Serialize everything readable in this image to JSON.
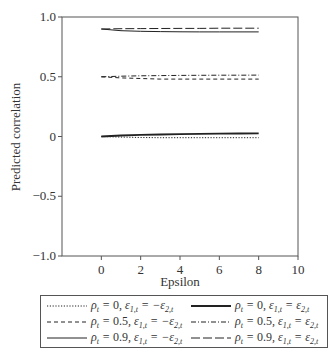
{
  "chart_data": {
    "type": "line",
    "title": "",
    "xlabel": "Epsilon",
    "ylabel": "Predicted correlation",
    "xlim": [
      -2,
      10
    ],
    "ylim": [
      -1.0,
      1.0
    ],
    "x_ticks": [
      0,
      2,
      4,
      6,
      8,
      10
    ],
    "x_tick_labels": [
      "0",
      "2",
      "4",
      "6",
      "8",
      "10"
    ],
    "y_ticks": [
      1.0,
      0.5,
      0,
      -0.5,
      -1.0
    ],
    "y_tick_labels": [
      "1.0",
      "0.5",
      "0",
      "−0.5",
      "−1.0"
    ],
    "grid": false,
    "legend_position": "below",
    "x": [
      0,
      1,
      2,
      3,
      4,
      5,
      6,
      7,
      8
    ],
    "series": [
      {
        "name": "ρt = 0, ε1,t = −ε2,t",
        "style": "dotted",
        "values": [
          0.0,
          -0.005,
          -0.008,
          -0.01,
          -0.01,
          -0.01,
          -0.01,
          -0.01,
          -0.01
        ]
      },
      {
        "name": "ρt = 0.5, ε1,t = −ε2,t",
        "style": "dashed",
        "values": [
          0.5,
          0.49,
          0.485,
          0.48,
          0.48,
          0.48,
          0.48,
          0.48,
          0.48
        ]
      },
      {
        "name": "ρt = 0.9, ε1,t = −ε2,t",
        "style": "solid-thin",
        "values": [
          0.9,
          0.885,
          0.88,
          0.878,
          0.876,
          0.875,
          0.875,
          0.875,
          0.875
        ]
      },
      {
        "name": "ρt = 0, ε1,t = ε2,t",
        "style": "solid-thick",
        "values": [
          0.0,
          0.008,
          0.013,
          0.017,
          0.02,
          0.022,
          0.024,
          0.025,
          0.026
        ]
      },
      {
        "name": "ρt = 0.5, ε1,t = ε2,t",
        "style": "dash-dot",
        "values": [
          0.5,
          0.505,
          0.508,
          0.51,
          0.511,
          0.512,
          0.513,
          0.513,
          0.514
        ]
      },
      {
        "name": "ρt = 0.9, ε1,t = ε2,t",
        "style": "long-dash",
        "values": [
          0.9,
          0.902,
          0.903,
          0.904,
          0.905,
          0.905,
          0.906,
          0.906,
          0.906
        ]
      }
    ]
  },
  "legend": {
    "items": [
      {
        "rho": "0",
        "rel": "−",
        "style": "dotted"
      },
      {
        "rho": "0.5",
        "rel": "−",
        "style": "dashed"
      },
      {
        "rho": "0.9",
        "rel": "−",
        "style": "solid-thin"
      },
      {
        "rho": "0",
        "rel": "",
        "style": "solid-thick"
      },
      {
        "rho": "0.5",
        "rel": "",
        "style": "dash-dot"
      },
      {
        "rho": "0.9",
        "rel": "",
        "style": "long-dash"
      }
    ]
  },
  "colors": {
    "line": "#222222",
    "axis": "#555555",
    "text": "#333333"
  }
}
